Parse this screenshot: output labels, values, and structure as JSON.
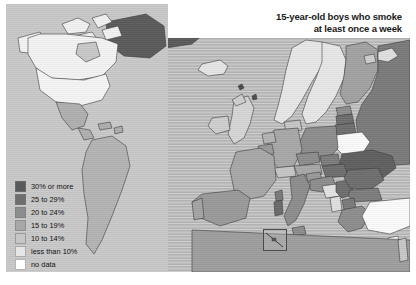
{
  "title": {
    "line1": "15-year-old boys who smoke",
    "line2": "at least once a week"
  },
  "legend": {
    "items": [
      {
        "label": "30% or more",
        "color": "#5a5a5a"
      },
      {
        "label": "25 to 29%",
        "color": "#6e6e6e"
      },
      {
        "label": "20 to 24%",
        "color": "#8d8d8d"
      },
      {
        "label": "15 to 19%",
        "color": "#a8a8a8"
      },
      {
        "label": "10 to 14%",
        "color": "#c6c6c6"
      },
      {
        "label": "less than 10%",
        "color": "#e6e6e6"
      },
      {
        "label": "no data",
        "color": "#ffffff"
      }
    ]
  },
  "map": {
    "sea_color": "#b9b9b9",
    "inset_sea_color": "#c9c9c9",
    "inset_name": "americas-inset",
    "callout_name": "malta-callout"
  }
}
